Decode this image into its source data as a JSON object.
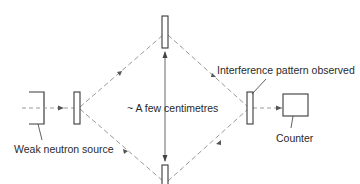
{
  "diagram": {
    "type": "neutron interferometer schematic",
    "labels": {
      "source": "Weak neutron source",
      "distance": "~ A few centimetres",
      "interference": "Interference pattern observed",
      "counter": "Counter"
    },
    "colors": {
      "outline": "#3a3a3a",
      "beam": "#9a9a9a",
      "arrow": "#555555",
      "text": "#2a2a2a",
      "background": "#ffffff"
    },
    "components": [
      {
        "id": "source",
        "name": "Weak neutron source"
      },
      {
        "id": "splitter-left",
        "name": "Beam splitter crystal"
      },
      {
        "id": "mirror-top",
        "name": "Mirror crystal (top)"
      },
      {
        "id": "mirror-bottom",
        "name": "Mirror crystal (bottom)"
      },
      {
        "id": "analyser-right",
        "name": "Analyser crystal"
      },
      {
        "id": "counter",
        "name": "Counter"
      }
    ]
  }
}
